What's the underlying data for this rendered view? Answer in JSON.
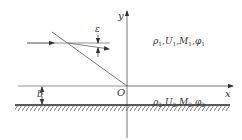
{
  "diagram": {
    "labels": {
      "y_axis": "y",
      "x_axis": "x",
      "origin": "O",
      "angle": "ε",
      "height": "b"
    },
    "region1": {
      "parts": [
        {
          "sym": "ρ",
          "sub": "1"
        },
        {
          "sym": "U",
          "sub": "1"
        },
        {
          "sym": "M",
          "sub": "1"
        },
        {
          "sym": "φ",
          "sub": "1"
        }
      ]
    },
    "region2": {
      "parts": [
        {
          "sym": "ρ",
          "sub": "2"
        },
        {
          "sym": "U",
          "sub": "2"
        },
        {
          "sym": "M",
          "sub": "2"
        },
        {
          "sym": "φ",
          "sub": "2"
        }
      ]
    },
    "colors": {
      "line": "#555555",
      "wall": "#222222",
      "text": "#333333"
    }
  }
}
